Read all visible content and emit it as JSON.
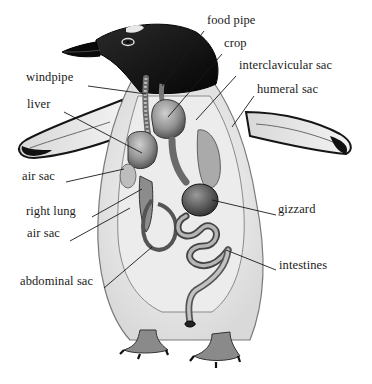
{
  "diagram": {
    "style": "grayscale illustration",
    "colors": {
      "background": "#ffffff",
      "ink": "#1a1a1a",
      "plumage_dark": "#0d0d0d",
      "body_light": "#eeeeee",
      "organ_mid": "#8a8a8a"
    },
    "labels": [
      {
        "id": "food-pipe",
        "text": "food pipe",
        "x": 207,
        "y": 22,
        "side": "right"
      },
      {
        "id": "crop",
        "text": "crop",
        "x": 224,
        "y": 45,
        "side": "right"
      },
      {
        "id": "interclavicular-sac",
        "text": "interclavicular sac",
        "x": 239,
        "y": 67,
        "side": "right"
      },
      {
        "id": "humeral-sac",
        "text": "humeral sac",
        "x": 257,
        "y": 91,
        "side": "right"
      },
      {
        "id": "windpipe",
        "text": "windpipe",
        "x": 26,
        "y": 79,
        "side": "left"
      },
      {
        "id": "liver",
        "text": "liver",
        "x": 27,
        "y": 106,
        "side": "left"
      },
      {
        "id": "air-sac-upper",
        "text": "air sac",
        "x": 22,
        "y": 178,
        "side": "left"
      },
      {
        "id": "right-lung",
        "text": "right lung",
        "x": 26,
        "y": 213,
        "side": "left"
      },
      {
        "id": "air-sac-lower",
        "text": "air sac",
        "x": 27,
        "y": 235,
        "side": "left"
      },
      {
        "id": "abdominal-sac",
        "text": "abdominal sac",
        "x": 20,
        "y": 283,
        "side": "left"
      },
      {
        "id": "gizzard",
        "text": "gizzard",
        "x": 278,
        "y": 211,
        "side": "right"
      },
      {
        "id": "intestines",
        "text": "intestines",
        "x": 279,
        "y": 267,
        "side": "right"
      }
    ],
    "leaders": [
      {
        "id": "food-pipe",
        "x1": 204,
        "y1": 31,
        "x2": 162,
        "y2": 86
      },
      {
        "id": "crop",
        "x1": 222,
        "y1": 54,
        "x2": 168,
        "y2": 117
      },
      {
        "id": "interclavicular-sac",
        "x1": 236,
        "y1": 76,
        "x2": 196,
        "y2": 120
      },
      {
        "id": "humeral-sac",
        "x1": 254,
        "y1": 96,
        "x2": 232,
        "y2": 127
      },
      {
        "id": "windpipe",
        "x1": 88,
        "y1": 86,
        "x2": 146,
        "y2": 94
      },
      {
        "id": "liver",
        "x1": 64,
        "y1": 112,
        "x2": 142,
        "y2": 153
      },
      {
        "id": "air-sac-upper",
        "x1": 66,
        "y1": 182,
        "x2": 124,
        "y2": 169
      },
      {
        "id": "right-lung",
        "x1": 92,
        "y1": 217,
        "x2": 142,
        "y2": 189
      },
      {
        "id": "air-sac-lower",
        "x1": 70,
        "y1": 241,
        "x2": 130,
        "y2": 208
      },
      {
        "id": "abdominal-sac",
        "x1": 104,
        "y1": 288,
        "x2": 152,
        "y2": 247
      },
      {
        "id": "gizzard",
        "x1": 276,
        "y1": 215,
        "x2": 212,
        "y2": 200
      },
      {
        "id": "intestines",
        "x1": 276,
        "y1": 270,
        "x2": 226,
        "y2": 250
      }
    ]
  }
}
